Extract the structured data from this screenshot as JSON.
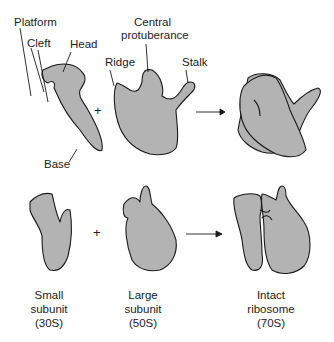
{
  "colors": {
    "fill": "#b3b3b3",
    "stroke": "#1a1a1a",
    "background": "#ffffff"
  },
  "labels": {
    "platform": "Platform",
    "cleft": "Cleft",
    "head": "Head",
    "base": "Base",
    "central_line1": "Central",
    "central_line2": "protuberance",
    "ridge": "Ridge",
    "stalk": "Stalk"
  },
  "operators": {
    "plus": "+"
  },
  "captions": [
    {
      "line1": "Small",
      "line2": "subunit",
      "line3": "(30S)"
    },
    {
      "line1": "Large",
      "line2": "subunit",
      "line3": "(50S)"
    },
    {
      "line1": "Intact",
      "line2": "ribosome",
      "line3": "(70S)"
    }
  ]
}
